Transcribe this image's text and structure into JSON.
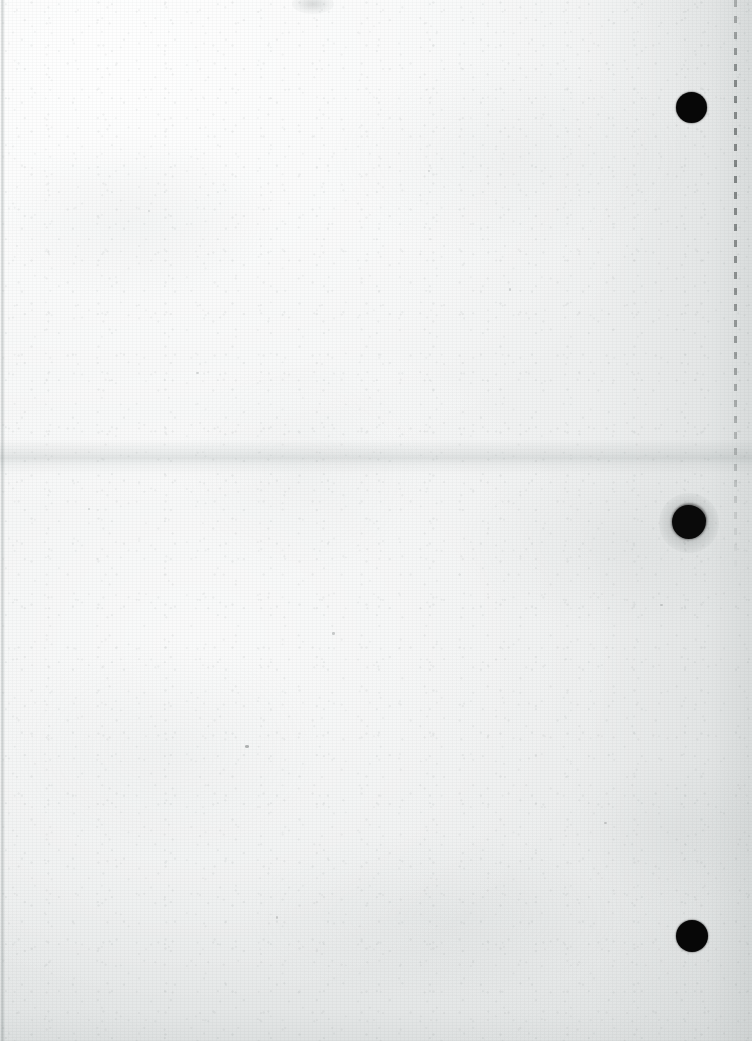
{
  "document": {
    "kind": "scanned-blank-page",
    "description": "Scan of a blank off-white sheet of paper with three black hole-punch marks along the right margin",
    "width": 752,
    "height": 1041,
    "visible_text": "",
    "has_text_content": false
  },
  "paper": {
    "base_color": "#f3f4f4",
    "highlight_color": "#ffffff",
    "shadow_color": "#d8dcdc",
    "texture": "fine speckled grain"
  },
  "marks": {
    "punch_holes": [
      {
        "name": "punch-hole-top",
        "center_x": 691,
        "center_y": 107,
        "diameter": 31,
        "edge": "clean",
        "color": "#070707"
      },
      {
        "name": "punch-hole-middle",
        "center_x": 689,
        "center_y": 522,
        "diameter": 34,
        "edge": "ragged",
        "color": "#0a0a0a"
      },
      {
        "name": "punch-hole-bottom",
        "center_x": 692,
        "center_y": 936,
        "diameter": 32,
        "edge": "clean",
        "color": "#070707"
      }
    ],
    "dashed_guide_line": {
      "name": "dashed-guide-line",
      "x": 734,
      "top": 0,
      "height": 575,
      "dash_length": 7,
      "gap_length": 9,
      "color": "#787c7c"
    },
    "horizontal_crease": {
      "name": "horizontal-crease",
      "y": 440,
      "height": 34,
      "color": "#d7dbdb"
    },
    "left_edge_line": {
      "name": "left-edge-line",
      "x": 1,
      "width": 4,
      "color": "#c4c8c8"
    },
    "top_smudge": {
      "name": "top-edge-smudge",
      "x": 292,
      "y": -6,
      "width": 42,
      "height": 20
    },
    "specks": [
      {
        "x": 245,
        "y": 745,
        "w": 4,
        "h": 3,
        "color": "rgba(140,144,144,0.62)"
      },
      {
        "x": 332,
        "y": 632,
        "w": 3,
        "h": 3,
        "color": "rgba(158,162,162,0.50)"
      },
      {
        "x": 196,
        "y": 372,
        "w": 3,
        "h": 2,
        "color": "rgba(164,168,168,0.45)"
      },
      {
        "x": 509,
        "y": 288,
        "w": 2,
        "h": 3,
        "color": "rgba(168,172,172,0.42)"
      },
      {
        "x": 604,
        "y": 822,
        "w": 3,
        "h": 2,
        "color": "rgba(160,164,164,0.48)"
      },
      {
        "x": 88,
        "y": 508,
        "w": 2,
        "h": 2,
        "color": "rgba(170,174,174,0.40)"
      },
      {
        "x": 428,
        "y": 170,
        "w": 2,
        "h": 2,
        "color": "rgba(172,176,176,0.38)"
      },
      {
        "x": 660,
        "y": 604,
        "w": 3,
        "h": 2,
        "color": "rgba(162,166,166,0.44)"
      },
      {
        "x": 276,
        "y": 916,
        "w": 2,
        "h": 3,
        "color": "rgba(166,170,170,0.42)"
      },
      {
        "x": 148,
        "y": 210,
        "w": 2,
        "h": 2,
        "color": "rgba(174,178,178,0.36)"
      }
    ]
  }
}
